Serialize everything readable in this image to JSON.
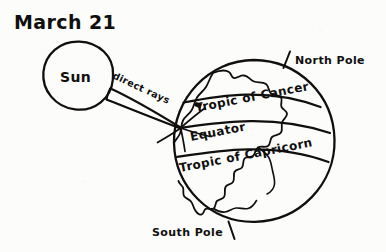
{
  "figure": {
    "title": "March 21",
    "background_color": "#fcfcfb",
    "ink_color": "#100f0d"
  },
  "sun": {
    "label": "Sun",
    "center_x": 78,
    "center_y": 76,
    "radius": 35
  },
  "rays": {
    "label": "direct rays",
    "label_rotation_deg": 25,
    "count": 2,
    "converge_x": 180,
    "converge_y": 128
  },
  "earth": {
    "center_x": 254,
    "center_y": 141,
    "radius": 81,
    "continent_name": "the-americas",
    "latitude_lines": [
      {
        "key": "tropic_of_cancer",
        "label": "Tropic of Cancer",
        "tilt_deg": -13
      },
      {
        "key": "equator",
        "label": "Equator",
        "tilt_deg": -13
      },
      {
        "key": "tropic_of_capricorn",
        "label": "Tropic of Capricorn",
        "tilt_deg": -13
      }
    ],
    "poles": [
      {
        "key": "north_pole",
        "label": "North Pole"
      },
      {
        "key": "south_pole",
        "label": "South Pole"
      }
    ]
  }
}
